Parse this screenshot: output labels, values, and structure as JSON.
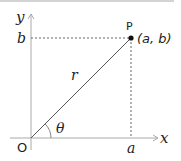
{
  "diagram": {
    "axes": {
      "x_label": "x",
      "y_label": "y",
      "origin_label": "O"
    },
    "point": {
      "name": "P",
      "coords_label": "(a,  b)"
    },
    "labels": {
      "a": "a",
      "b": "b",
      "radius": "r",
      "angle": "θ"
    },
    "colors": {
      "axis": "#aaaaaa",
      "line": "#555555",
      "dashed": "#666666",
      "point": "#111111",
      "text": "#222222"
    }
  }
}
